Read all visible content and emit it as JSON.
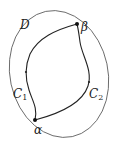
{
  "diagram": {
    "region_label": "D",
    "start_point_label": "α",
    "end_point_label": "β",
    "curves": [
      {
        "name": "C",
        "subscript": "1"
      },
      {
        "name": "C",
        "subscript": "2"
      }
    ],
    "colors": {
      "stroke": "#222222",
      "region": "#555555",
      "background": "#ffffff"
    }
  }
}
